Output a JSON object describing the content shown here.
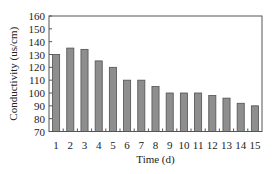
{
  "chart_data": {
    "type": "bar",
    "title": "",
    "xlabel": "Time (d)",
    "ylabel": "Conductivity (us/cm)",
    "categories": [
      "1",
      "2",
      "3",
      "4",
      "5",
      "6",
      "7",
      "8",
      "9",
      "10",
      "11",
      "12",
      "13",
      "14",
      "15"
    ],
    "values": [
      130,
      135,
      134,
      125,
      120,
      110,
      110,
      105,
      100,
      100,
      100,
      98,
      96,
      92,
      90
    ],
    "ylim": [
      70,
      160
    ],
    "yticks": [
      70,
      80,
      90,
      100,
      110,
      120,
      130,
      140,
      150,
      160
    ],
    "grid": false,
    "legend": null,
    "colors": {
      "bar_fill": "#8e8e8e",
      "bar_stroke": "#505050",
      "axis": "#555555"
    }
  }
}
